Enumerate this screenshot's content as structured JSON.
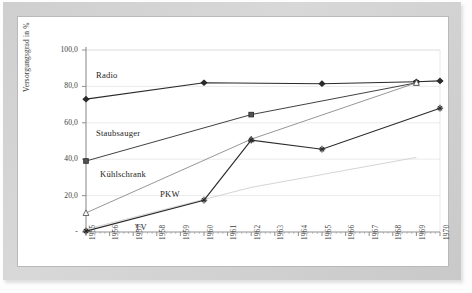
{
  "figure": {
    "ylabel": "Versorgungsgrad in %",
    "y_ticks": [
      "100,0",
      "80,0",
      "60,0",
      "40,0",
      "20,0",
      "-"
    ],
    "x_ticks": [
      "1955",
      "1956",
      "1957",
      "1958",
      "1959",
      "1960",
      "1961",
      "1962",
      "1963",
      "1964",
      "1965",
      "1966",
      "1967",
      "1968",
      "1969",
      "1970"
    ],
    "series_labels": {
      "radio": "Radio",
      "staubsauger": "Staubsauger",
      "kuehlschrank": "Kühlschrank",
      "pkw": "PKW",
      "tv": "TV"
    },
    "colors": {
      "frame": "#cfcfcf",
      "axis": "#8f8f8f",
      "grid": "#e2e2e2",
      "ink": "#2b2b2b",
      "faint": "#d5d5d5"
    }
  },
  "chart_data": {
    "type": "line",
    "title": "",
    "xlabel": "",
    "ylabel": "Versorgungsgrad in %",
    "xlim": [
      1955,
      1970
    ],
    "ylim": [
      0,
      100
    ],
    "grid": true,
    "legend": "inline-labels",
    "x": [
      1955,
      1956,
      1957,
      1958,
      1959,
      1960,
      1961,
      1962,
      1963,
      1964,
      1965,
      1966,
      1967,
      1968,
      1969,
      1970
    ],
    "series": [
      {
        "name": "Radio",
        "marker": "filled-diamond",
        "points": [
          {
            "x": 1955,
            "y": 73.0
          },
          {
            "x": 1960,
            "y": 82.0
          },
          {
            "x": 1965,
            "y": 81.5
          },
          {
            "x": 1969,
            "y": 82.5
          },
          {
            "x": 1970,
            "y": 83.0
          }
        ]
      },
      {
        "name": "Staubsauger",
        "marker": "filled-square",
        "points": [
          {
            "x": 1955,
            "y": 39.0
          },
          {
            "x": 1962,
            "y": 64.5
          },
          {
            "x": 1969,
            "y": 82.0
          }
        ]
      },
      {
        "name": "Kühlschrank",
        "marker": "open-triangle",
        "points": [
          {
            "x": 1955,
            "y": 10.5
          },
          {
            "x": 1962,
            "y": 51.0
          },
          {
            "x": 1969,
            "y": 82.0
          }
        ]
      },
      {
        "name": "PKW",
        "marker": "none",
        "points": [
          {
            "x": 1955,
            "y": 1.5
          },
          {
            "x": 1962,
            "y": 24.5
          },
          {
            "x": 1969,
            "y": 41.0
          }
        ]
      },
      {
        "name": "TV",
        "marker": "star",
        "points": [
          {
            "x": 1955,
            "y": 0.5
          },
          {
            "x": 1960,
            "y": 17.5
          },
          {
            "x": 1962,
            "y": 50.5
          },
          {
            "x": 1965,
            "y": 45.5
          },
          {
            "x": 1970,
            "y": 68.0
          }
        ]
      }
    ]
  }
}
